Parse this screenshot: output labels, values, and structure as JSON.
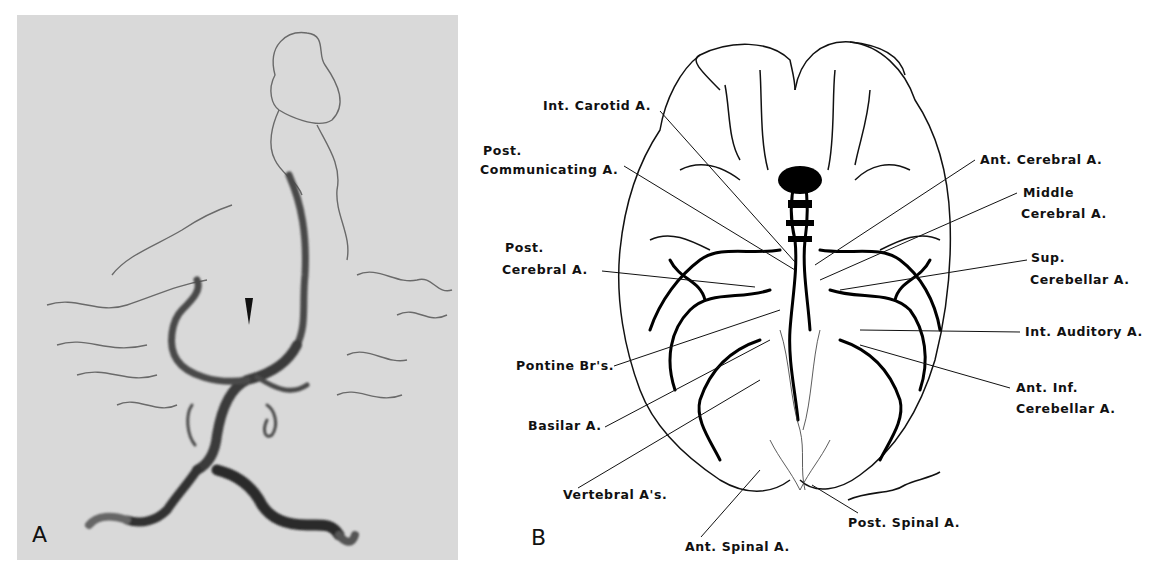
{
  "panel_a": {
    "letter": "A",
    "description": "Vertebral-basilar angiogram with arrowhead",
    "background": "#d9d9d9",
    "arrowhead": "arrowhead-marker"
  },
  "panel_b": {
    "letter": "B",
    "description": "Inferior view of brain with arterial supply",
    "signature": "Kalling",
    "labels": {
      "int_carotid": "Int. Carotid A.",
      "post_communicating_1": "Post.",
      "post_communicating_2": "Communicating A.",
      "post_cerebral_1": "Post.",
      "post_cerebral_2": "Cerebral A.",
      "pontine": "Pontine Br's.",
      "basilar": "Basilar A.",
      "vertebral": "Vertebral A's.",
      "ant_spinal": "Ant. Spinal A.",
      "post_spinal": "Post. Spinal A.",
      "ant_cerebral": "Ant. Cerebral A.",
      "middle_cerebral_1": "Middle",
      "middle_cerebral_2": "Cerebral A.",
      "sup_cerebellar_1": "Sup.",
      "sup_cerebellar_2": "Cerebellar A.",
      "int_auditory": "Int. Auditory A.",
      "ant_inf_cerebellar_1": "Ant. Inf.",
      "ant_inf_cerebellar_2": "Cerebellar A."
    }
  }
}
